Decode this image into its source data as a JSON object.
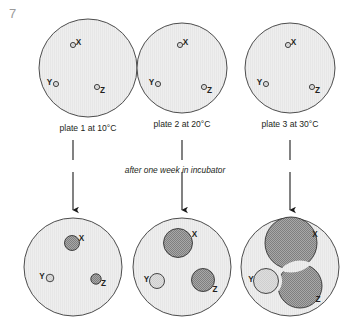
{
  "figure": {
    "number": "7",
    "incubation_note": "after one week in incubator",
    "organisms": [
      "X",
      "Y",
      "Z"
    ]
  },
  "colors": {
    "plate_fill": "#eeeeee",
    "plate_stroke": "#4d4d4d",
    "colony_dark": "#9a9a9a",
    "colony_light": "#dcdcdc",
    "colony_stroke": "#333333",
    "label_text": "#231f20",
    "fignum_text": "#9b9b9b",
    "arrow": "#1a1a1a"
  },
  "top_row": {
    "plates": [
      {
        "id": "plate-1-before",
        "caption": "plate 1 at 10°C",
        "cx": 88,
        "cy": 68,
        "r": 49,
        "colonies": [
          {
            "organism": "X",
            "cx": 73,
            "cy": 45,
            "r": 2.6,
            "shade": "light",
            "label_dx": 5.5,
            "label_dy": -2.5
          },
          {
            "organism": "Y",
            "cx": 56,
            "cy": 84,
            "r": 2.6,
            "shade": "light",
            "label_dx": -6.5,
            "label_dy": -1.5
          },
          {
            "organism": "Z",
            "cx": 97,
            "cy": 87,
            "r": 2.6,
            "shade": "light",
            "label_dx": 5.5,
            "label_dy": 3.5
          }
        ]
      },
      {
        "id": "plate-2-before",
        "caption": "plate 2 at 20°C",
        "cx": 182,
        "cy": 68,
        "r": 45,
        "colonies": [
          {
            "organism": "X",
            "cx": 180,
            "cy": 45,
            "r": 2.6,
            "shade": "light",
            "label_dx": 5.5,
            "label_dy": -2.5
          },
          {
            "organism": "Y",
            "cx": 158,
            "cy": 84,
            "r": 2.6,
            "shade": "light",
            "label_dx": -6.5,
            "label_dy": -1.5
          },
          {
            "organism": "Z",
            "cx": 204,
            "cy": 87,
            "r": 2.6,
            "shade": "light",
            "label_dx": 5.5,
            "label_dy": 3.5
          }
        ]
      },
      {
        "id": "plate-3-before",
        "caption": "plate 3 at 30°C",
        "cx": 290,
        "cy": 68,
        "r": 45,
        "colonies": [
          {
            "organism": "X",
            "cx": 288,
            "cy": 45,
            "r": 2.6,
            "shade": "light",
            "label_dx": 5.5,
            "label_dy": -2.5
          },
          {
            "organism": "Y",
            "cx": 266,
            "cy": 84,
            "r": 2.6,
            "shade": "light",
            "label_dx": -6.5,
            "label_dy": -1.5
          },
          {
            "organism": "Z",
            "cx": 312,
            "cy": 87,
            "r": 2.6,
            "shade": "light",
            "label_dx": 5.5,
            "label_dy": 3.5
          }
        ]
      }
    ]
  },
  "bottom_row": {
    "plates": [
      {
        "id": "plate-1-after",
        "cx": 73,
        "cy": 267,
        "r": 49,
        "colonies": [
          {
            "organism": "X",
            "cx": 72,
            "cy": 243,
            "r": 7.5,
            "shade": "dark",
            "label_dx": 9.5,
            "label_dy": -4.0
          },
          {
            "organism": "Y",
            "cx": 50,
            "cy": 278,
            "r": 3.8,
            "shade": "light",
            "label_dx": -8.0,
            "label_dy": -1.0
          },
          {
            "organism": "Z",
            "cx": 96,
            "cy": 279,
            "r": 5.2,
            "shade": "dark",
            "label_dx": 7.5,
            "label_dy": 5.0
          }
        ]
      },
      {
        "id": "plate-2-after",
        "cx": 182,
        "cy": 267,
        "r": 49,
        "colonies": [
          {
            "organism": "X",
            "cx": 178,
            "cy": 243,
            "r": 14.5,
            "shade": "dark",
            "label_dx": 16.5,
            "label_dy": -8.0
          },
          {
            "organism": "Y",
            "cx": 157,
            "cy": 281,
            "r": 7.5,
            "shade": "light",
            "label_dx": -10.5,
            "label_dy": -1.0
          },
          {
            "organism": "Z",
            "cx": 203,
            "cy": 280,
            "r": 11.5,
            "shade": "dark",
            "label_dx": 12.0,
            "label_dy": 10.0
          }
        ]
      },
      {
        "id": "plate-3-after",
        "cx": 290,
        "cy": 267,
        "r": 49,
        "colonies": [
          {
            "organism": "X",
            "cx": 291,
            "cy": 243,
            "r": 26.0,
            "shade": "dark",
            "label_dx": 24.0,
            "label_dy": -8.0
          },
          {
            "organism": "Y",
            "cx": 266,
            "cy": 281,
            "r": 12.5,
            "shade": "light",
            "label_dx": -15.0,
            "label_dy": -1.0
          },
          {
            "organism": "Z",
            "cx": 300,
            "cy": 286,
            "r": 22.0,
            "shade": "dark",
            "label_dx": 18.0,
            "label_dy": 14.0
          }
        ]
      }
    ]
  },
  "arrows": [
    {
      "id": "arrow-plate-1",
      "x": 73,
      "y_top": 140,
      "y_mid_end": 160,
      "y_resume": 172,
      "y_bottom": 210
    },
    {
      "id": "arrow-plate-2",
      "x": 182,
      "y_top": 140,
      "y_mid_end": 160,
      "y_resume": 172,
      "y_bottom": 210
    },
    {
      "id": "arrow-plate-3",
      "x": 290,
      "y_top": 140,
      "y_mid_end": 160,
      "y_resume": 172,
      "y_bottom": 210
    }
  ]
}
